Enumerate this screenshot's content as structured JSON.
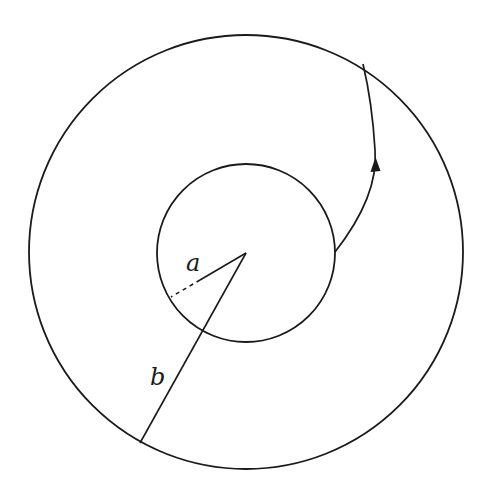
{
  "diagram": {
    "title": "",
    "outer_circle": {
      "cx": 246,
      "cy": 252,
      "r": 217
    },
    "inner_circle": {
      "cx": 246,
      "cy": 253,
      "r": 89
    },
    "center": {
      "x": 246,
      "y": 253
    },
    "labels": {
      "a": "a",
      "b": "b"
    },
    "radius_a_end": {
      "x": 171,
      "y": 297
    },
    "radius_b_end": {
      "x": 140,
      "y": 443
    },
    "path": {
      "start": {
        "x": 335,
        "y": 253
      },
      "end": {
        "x": 363,
        "y": 65
      },
      "direction": "outward (arrow pointing up along path)"
    },
    "stroke_color": "#1a1a1a",
    "background_color": "#ffffff"
  }
}
